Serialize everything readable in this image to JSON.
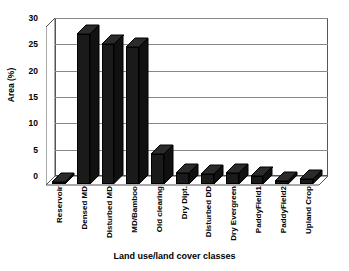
{
  "chart_data": {
    "type": "bar",
    "title": "",
    "xlabel": "Land use/land cover classes",
    "ylabel": "Area (%)",
    "ylim": [
      0,
      30
    ],
    "ytick_labels": [
      "0",
      "5",
      "10",
      "15",
      "20",
      "25",
      "30"
    ],
    "ytick_values": [
      0,
      5,
      10,
      15,
      20,
      25,
      30
    ],
    "grid": true,
    "legend": "none",
    "style": "3d-column",
    "bar_color": "#1a1a1a",
    "categories": [
      "Reservoir",
      "Densed MD",
      "Disturbed MD",
      "MD/Bamboo",
      "Old clearing",
      "Dry Dipt.",
      "Disturbed DD",
      "Dry Evergreen",
      "PaddyField1",
      "PaddyField2",
      "Upland  Crop"
    ],
    "values": [
      0.3,
      28.5,
      26.5,
      26.0,
      5.7,
      2.1,
      1.9,
      2.1,
      1.5,
      0.6,
      0.9
    ]
  }
}
